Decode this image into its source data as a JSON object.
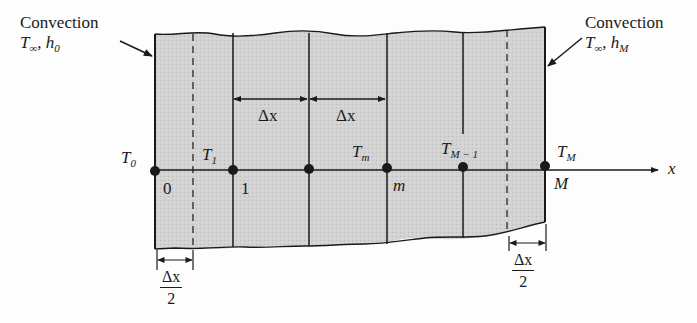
{
  "diagram": {
    "type": "finite-difference slab discretization",
    "left_boundary": {
      "label": "Convection",
      "params": {
        "T": "T",
        "T_sub": "∞",
        "h": "h",
        "h_sub": "0"
      }
    },
    "right_boundary": {
      "label": "Convection",
      "params": {
        "T": "T",
        "T_sub": "∞",
        "h": "h",
        "h_sub": "M"
      }
    },
    "axis_label": "x",
    "nodes": [
      {
        "temp": "T",
        "temp_sub": "0",
        "index": "0"
      },
      {
        "temp": "T",
        "temp_sub": "1",
        "index": "1"
      },
      {
        "temp": "",
        "temp_sub": "",
        "index": ""
      },
      {
        "temp": "T",
        "temp_sub": "m",
        "index": "m"
      },
      {
        "temp": "T",
        "temp_sub": "M − 1",
        "index": ""
      },
      {
        "temp": "T",
        "temp_sub": "M",
        "index": "M"
      }
    ],
    "spacing_labels": {
      "full": "Δx",
      "half_num": "Δx",
      "half_den": "2"
    },
    "colors": {
      "slab_fill": "#cfcfcf",
      "line": "#1a1a1a",
      "background": "#fdfdfd"
    }
  }
}
